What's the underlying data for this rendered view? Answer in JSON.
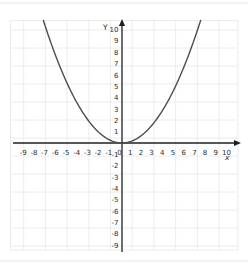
{
  "chart_data": {
    "type": "line",
    "title": "",
    "xlabel": "x",
    "ylabel": "Y",
    "x_ticks": [
      -9,
      -8,
      -7,
      -6,
      -5,
      -4,
      -3,
      -2,
      -1,
      0,
      1,
      2,
      3,
      4,
      5,
      6,
      7,
      8,
      9,
      10
    ],
    "y_ticks": [
      10,
      9,
      8,
      7,
      6,
      5,
      4,
      3,
      2,
      1,
      -1,
      -2,
      -3,
      -4,
      -5,
      -6,
      -7,
      -8,
      -9
    ],
    "xlim": [
      -10.4,
      10.8
    ],
    "ylim": [
      -9.6,
      11.1
    ],
    "grid": true,
    "legend": "none",
    "series": [
      {
        "name": "upward parabola, vertex at origin",
        "equation": "y = 0.2x^2",
        "coefficient_a": 0.2,
        "draw_range": [
          -7.35,
          7.35
        ],
        "points": [
          [
            -7,
            9.8
          ],
          [
            -6,
            7.2
          ],
          [
            -5,
            5.0
          ],
          [
            -4,
            3.2
          ],
          [
            -3,
            1.8
          ],
          [
            -2,
            0.8
          ],
          [
            -1,
            0.2
          ],
          [
            0,
            0
          ],
          [
            1,
            0.2
          ],
          [
            2,
            0.8
          ],
          [
            3,
            1.8
          ],
          [
            4,
            3.2
          ],
          [
            5,
            5.0
          ],
          [
            6,
            7.2
          ],
          [
            7,
            9.8
          ]
        ],
        "color": "#4d4d4d"
      }
    ],
    "colors": {
      "axis": "#1f1f1f",
      "tick_label": "#2b2b2b",
      "grid": "#e7e7e7",
      "page_line": "#efefef",
      "background": "#ffffff"
    }
  }
}
